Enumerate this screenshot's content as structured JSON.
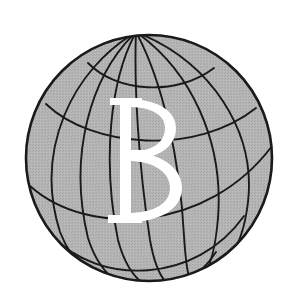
{
  "image": {
    "kind": "logo-emblem",
    "subject": "globe-with-letter",
    "width": 289,
    "height": 307
  },
  "canvas": {
    "background_color": "#ffffff",
    "width": 289,
    "height": 307
  },
  "globe": {
    "name": "globe",
    "center_x": 149,
    "center_y": 158,
    "radius": 124,
    "fill_color": "#b2b2b2",
    "line_color": "#1a1a1a",
    "outline_width": 2.6,
    "graticule_width": 1.9,
    "halftone": "dithered-gray-screen",
    "axis_tilt_degrees": -28,
    "north_pole_x": 136,
    "north_pole_y": 32,
    "south_pole_x": 193,
    "south_pole_y": 281,
    "meridian_count": 8,
    "parallel_count": 5
  },
  "letter": {
    "name": "letter-b",
    "glyph": "B",
    "color": "#ffffff",
    "style": "serif-didone",
    "center_x": 146,
    "center_y": 160,
    "height_px": 132
  },
  "labels": {
    "title": "Globe B Emblem"
  }
}
